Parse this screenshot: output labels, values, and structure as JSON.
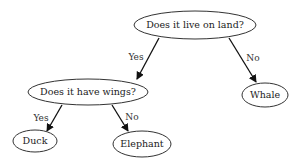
{
  "diagram": {
    "type": "decision-tree",
    "nodes": [
      {
        "id": "root",
        "label": "Does it live on land?"
      },
      {
        "id": "wings",
        "label": "Does it have wings?"
      },
      {
        "id": "whale",
        "label": "Whale"
      },
      {
        "id": "duck",
        "label": "Duck"
      },
      {
        "id": "elephant",
        "label": "Elephant"
      }
    ],
    "edges": [
      {
        "from": "root",
        "to": "wings",
        "label": "Yes"
      },
      {
        "from": "root",
        "to": "whale",
        "label": "No"
      },
      {
        "from": "wings",
        "to": "duck",
        "label": "Yes"
      },
      {
        "from": "wings",
        "to": "elephant",
        "label": "No"
      }
    ]
  }
}
